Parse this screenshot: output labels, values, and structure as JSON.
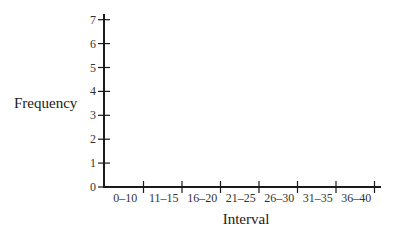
{
  "chart_data": {
    "type": "bar",
    "title": "",
    "xlabel": "Interval",
    "ylabel": "Frequency",
    "categories": [
      "0–10",
      "11–15",
      "16–20",
      "21–25",
      "26–30",
      "31–35",
      "36–40"
    ],
    "values": [
      null,
      null,
      null,
      null,
      null,
      null,
      null
    ],
    "yticks": [
      "0",
      "1",
      "2",
      "3",
      "4",
      "5",
      "6",
      "7"
    ],
    "ylim": [
      0,
      7
    ],
    "grid": false,
    "legend": null,
    "note": "Empty frequency histogram axes; no bars drawn"
  }
}
